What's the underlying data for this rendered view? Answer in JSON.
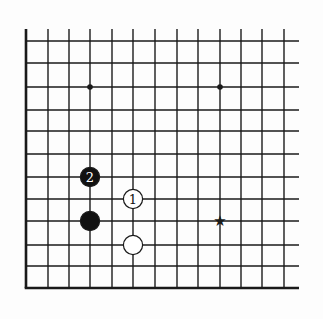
{
  "diagram": {
    "type": "go-board-fragment",
    "colors": {
      "background": "#fdfdfd",
      "line": "#1a1a1a",
      "black_stone": "#111111",
      "white_stone": "#ffffff"
    },
    "grid": {
      "x_lines": [
        26,
        48,
        69,
        90,
        112,
        133,
        155,
        177,
        198,
        220,
        241,
        262,
        284
      ],
      "y_lines": [
        41,
        63,
        87,
        110,
        131,
        154,
        177,
        199,
        221,
        245,
        266,
        288
      ],
      "top_stub": 29,
      "right_extent": 299,
      "left_edge": true,
      "bottom_edge": true
    },
    "hoshi": [
      {
        "col": 3,
        "row": 2
      },
      {
        "col": 9,
        "row": 2
      }
    ],
    "stones": [
      {
        "color": "black",
        "col": 3,
        "row": 6,
        "label": "2"
      },
      {
        "color": "white",
        "col": 5,
        "row": 7,
        "label": "1"
      },
      {
        "color": "black",
        "col": 3,
        "row": 8,
        "label": ""
      },
      {
        "color": "white",
        "col": 5,
        "row": 9,
        "label": ""
      }
    ],
    "markers": [
      {
        "type": "star",
        "col": 9,
        "row": 8,
        "glyph": "★"
      }
    ]
  }
}
